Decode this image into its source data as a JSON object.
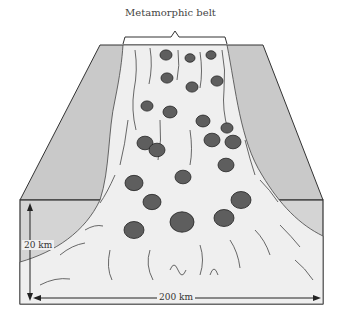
{
  "diagram": {
    "title": "Metamorphic belt",
    "depth_label": "20 km",
    "width_label": "200 km",
    "colors": {
      "background": "#ffffff",
      "block_face": "#c9c9c9",
      "front_face": "#d4d4d4",
      "belt": "#efefef",
      "pluton": "#5e5e5e",
      "outline": "#333333"
    },
    "plutons": [
      {
        "x": 166,
        "y": 55,
        "r": 6
      },
      {
        "x": 190,
        "y": 58,
        "r": 5
      },
      {
        "x": 211,
        "y": 55,
        "r": 5
      },
      {
        "x": 167,
        "y": 78,
        "r": 6
      },
      {
        "x": 192,
        "y": 87,
        "r": 6
      },
      {
        "x": 217,
        "y": 81,
        "r": 6
      },
      {
        "x": 147,
        "y": 106,
        "r": 6
      },
      {
        "x": 170,
        "y": 112,
        "r": 7
      },
      {
        "x": 203,
        "y": 121,
        "r": 7
      },
      {
        "x": 227,
        "y": 128,
        "r": 6
      },
      {
        "x": 212,
        "y": 140,
        "r": 8
      },
      {
        "x": 233,
        "y": 142,
        "r": 8
      },
      {
        "x": 145,
        "y": 143,
        "r": 8
      },
      {
        "x": 157,
        "y": 150,
        "r": 8
      },
      {
        "x": 226,
        "y": 165,
        "r": 8
      },
      {
        "x": 134,
        "y": 183,
        "r": 9
      },
      {
        "x": 183,
        "y": 177,
        "r": 8
      },
      {
        "x": 152,
        "y": 202,
        "r": 9
      },
      {
        "x": 241,
        "y": 200,
        "r": 10
      },
      {
        "x": 134,
        "y": 230,
        "r": 10
      },
      {
        "x": 182,
        "y": 222,
        "r": 12
      },
      {
        "x": 224,
        "y": 218,
        "r": 10
      }
    ]
  }
}
